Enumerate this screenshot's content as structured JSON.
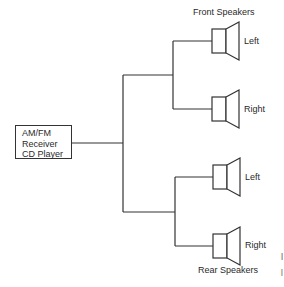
{
  "diagram": {
    "source": {
      "lines": [
        "AM/FM",
        "Receiver",
        "CD Player"
      ]
    },
    "groups": {
      "front": "Front Speakers",
      "rear": "Rear Speakers"
    },
    "speakers": [
      {
        "label": "Left",
        "group": "front"
      },
      {
        "label": "Right",
        "group": "front"
      },
      {
        "label": "Left",
        "group": "rear"
      },
      {
        "label": "Right",
        "group": "rear"
      }
    ],
    "marks": [
      "|",
      "|"
    ]
  }
}
